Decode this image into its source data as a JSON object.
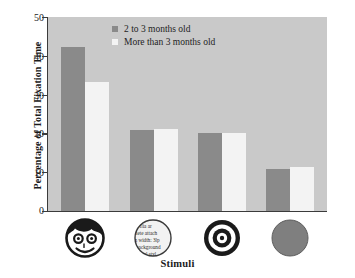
{
  "chart_data": {
    "type": "bar",
    "title": "",
    "xlabel": "Stimuli",
    "ylabel": "Percentage of Total Fixation Time",
    "ylim": [
      0,
      50
    ],
    "yticks": [
      0,
      10,
      20,
      30,
      40,
      50
    ],
    "ytick_labels": [
      "0",
      "10",
      "20",
      "30",
      "40",
      "50"
    ],
    "grid": false,
    "legend_position": "top-center",
    "categories": [
      "face",
      "scrambled-face",
      "bullseye",
      "blank-disc"
    ],
    "category_icons": [
      "face-icon",
      "scrambled-face-icon",
      "bullseye-icon",
      "blank-disc-icon"
    ],
    "series": [
      {
        "name": "2 to 3 months old",
        "color": "#8a8a8a",
        "values": [
          42.4,
          21.0,
          20.0,
          10.9
        ]
      },
      {
        "name": "More than 3 months old",
        "color": "#f3f3f3",
        "values": [
          33.3,
          21.2,
          20.2,
          11.3
        ]
      }
    ]
  },
  "legend": {
    "items": [
      {
        "label": "2 to 3 months old",
        "swatch": "dark"
      },
      {
        "label": "More than 3 months old",
        "swatch": "light"
      }
    ]
  },
  "axes": {
    "y_title": "Percentage of Total Fixation Time",
    "x_title": "Stimuli"
  },
  "colors": {
    "plot_background": "#c9c9c9",
    "page_background": "#ffffff",
    "series_dark": "#8a8a8a",
    "series_light": "#f3f3f3",
    "axis": "#3b3b3b",
    "text": "#1b1b1b",
    "stimulus_ink": "#1a1a1a",
    "stimulus_disc": "#7f7f7f"
  },
  "stimuli": {
    "scrambled_text_lines": [
      "flia ar",
      "iete attach",
      "n width: 3lp",
      "background",
      "ical styl"
    ]
  }
}
